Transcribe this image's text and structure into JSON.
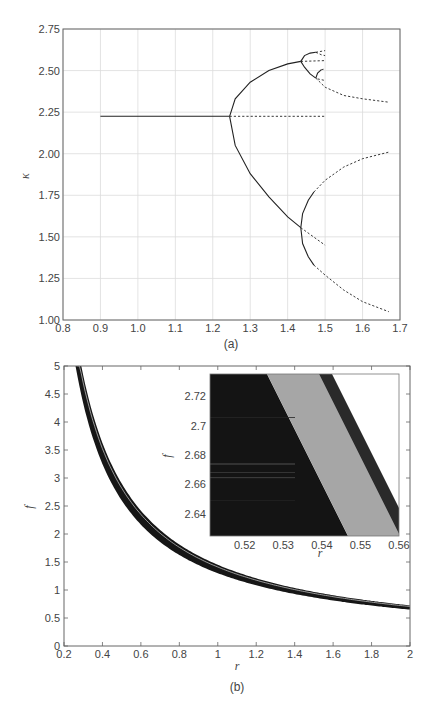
{
  "chart_data": [
    {
      "id": "a",
      "type": "line",
      "caption": "(a)",
      "title": "",
      "xlabel": "",
      "ylabel": "κ",
      "xlim": [
        0.8,
        1.7
      ],
      "ylim": [
        1.0,
        2.75
      ],
      "grid": true,
      "xticks": [
        "0.8",
        "0.9",
        "1.0",
        "1.1",
        "1.2",
        "1.3",
        "1.4",
        "1.5",
        "1.6",
        "1.7"
      ],
      "yticks": [
        "1.00",
        "1.25",
        "1.50",
        "1.75",
        "2.00",
        "2.25",
        "2.50",
        "2.75"
      ],
      "series": [
        {
          "name": "fixed point (stable)",
          "style": "solid",
          "points": [
            [
              0.9,
              2.225
            ],
            [
              1.245,
              2.225
            ]
          ]
        },
        {
          "name": "fixed point (unstable)",
          "style": "dashed",
          "points": [
            [
              1.245,
              2.225
            ],
            [
              1.5,
              2.225
            ]
          ]
        },
        {
          "name": "period-2 upper (stable)",
          "style": "solid",
          "points": [
            [
              1.245,
              2.225
            ],
            [
              1.26,
              2.33
            ],
            [
              1.3,
              2.43
            ],
            [
              1.35,
              2.5
            ],
            [
              1.4,
              2.54
            ],
            [
              1.435,
              2.555
            ]
          ]
        },
        {
          "name": "period-2 lower (stable)",
          "style": "solid",
          "points": [
            [
              1.245,
              2.225
            ],
            [
              1.26,
              2.05
            ],
            [
              1.3,
              1.88
            ],
            [
              1.35,
              1.74
            ],
            [
              1.4,
              1.62
            ],
            [
              1.435,
              1.555
            ]
          ]
        },
        {
          "name": "period-2 upper (unstable)",
          "style": "dashed",
          "points": [
            [
              1.435,
              2.555
            ],
            [
              1.5,
              2.56
            ]
          ]
        },
        {
          "name": "period-2 lower (unstable)",
          "style": "dashed",
          "points": [
            [
              1.435,
              1.555
            ],
            [
              1.5,
              1.45
            ]
          ]
        },
        {
          "name": "period-4 a (stable)",
          "style": "solid",
          "points": [
            [
              1.435,
              2.555
            ],
            [
              1.445,
              2.59
            ],
            [
              1.46,
              2.605
            ],
            [
              1.475,
              2.61
            ]
          ]
        },
        {
          "name": "period-4 b (stable)",
          "style": "solid",
          "points": [
            [
              1.435,
              2.555
            ],
            [
              1.445,
              2.52
            ],
            [
              1.46,
              2.48
            ],
            [
              1.475,
              2.455
            ]
          ]
        },
        {
          "name": "period-4 c (stable)",
          "style": "solid",
          "points": [
            [
              1.435,
              1.555
            ],
            [
              1.44,
              1.64
            ],
            [
              1.455,
              1.72
            ],
            [
              1.47,
              1.77
            ]
          ]
        },
        {
          "name": "period-4 d (stable)",
          "style": "solid",
          "points": [
            [
              1.435,
              1.555
            ],
            [
              1.44,
              1.46
            ],
            [
              1.455,
              1.38
            ],
            [
              1.47,
              1.33
            ]
          ]
        },
        {
          "name": "period-4 c (unstable)",
          "style": "dashed",
          "points": [
            [
              1.47,
              1.77
            ],
            [
              1.5,
              1.84
            ],
            [
              1.55,
              1.92
            ],
            [
              1.6,
              1.97
            ],
            [
              1.67,
              2.01
            ]
          ]
        },
        {
          "name": "period-4 d (unstable)",
          "style": "dashed",
          "points": [
            [
              1.47,
              1.33
            ],
            [
              1.5,
              1.27
            ],
            [
              1.55,
              1.18
            ],
            [
              1.6,
              1.11
            ],
            [
              1.67,
              1.05
            ]
          ]
        },
        {
          "name": "period-4 b (unstable)",
          "style": "dashed",
          "points": [
            [
              1.475,
              2.455
            ],
            [
              1.5,
              2.4
            ],
            [
              1.55,
              2.35
            ],
            [
              1.6,
              2.33
            ],
            [
              1.67,
              2.31
            ]
          ]
        },
        {
          "name": "period-8 (stable)",
          "style": "solid",
          "points": [
            [
              1.475,
              2.455
            ],
            [
              1.48,
              2.485
            ],
            [
              1.49,
              2.505
            ]
          ]
        },
        {
          "name": "period-8 (unstable)",
          "style": "dashed",
          "points": [
            [
              1.49,
              2.505
            ],
            [
              1.5,
              2.51
            ]
          ]
        },
        {
          "name": "period-8 upper (unstable)",
          "style": "dashed",
          "points": [
            [
              1.475,
              2.61
            ],
            [
              1.5,
              2.62
            ]
          ]
        },
        {
          "name": "period-8 upper b (unstable)",
          "style": "dashed",
          "points": [
            [
              1.475,
              2.61
            ],
            [
              1.49,
              2.595
            ],
            [
              1.5,
              2.59
            ]
          ]
        },
        {
          "name": "period-4 a (unstable)",
          "style": "dashed",
          "points": [
            [
              1.48,
              2.45
            ],
            [
              1.5,
              2.44
            ]
          ]
        }
      ]
    },
    {
      "id": "b",
      "type": "area",
      "caption": "(b)",
      "title": "",
      "xlabel": "r",
      "ylabel": "f",
      "xlim": [
        0.2,
        2.0
      ],
      "ylim": [
        0,
        5
      ],
      "grid": false,
      "xticks": [
        "0.2",
        "0.4",
        "0.6",
        "0.8",
        "1",
        "1.2",
        "1.4",
        "1.6",
        "1.8",
        "2"
      ],
      "yticks": [
        "0",
        "0.5",
        "1",
        "1.5",
        "2",
        "2.5",
        "3",
        "3.5",
        "4",
        "4.5",
        "5"
      ],
      "band": {
        "description": "dark band f ≈ c/r",
        "upper_c": 1.45,
        "lower_c": 1.3,
        "r": [
          0.26,
          0.3,
          0.35,
          0.4,
          0.5,
          0.6,
          0.8,
          1.0,
          1.2,
          1.4,
          1.6,
          1.8,
          2.0
        ],
        "upper_f": [
          5.0,
          4.83,
          4.14,
          3.63,
          2.9,
          2.42,
          1.81,
          1.45,
          1.21,
          1.04,
          0.91,
          0.81,
          0.73
        ],
        "lower_f": [
          5.0,
          4.33,
          3.71,
          3.25,
          2.6,
          2.17,
          1.63,
          1.3,
          1.08,
          0.93,
          0.81,
          0.72,
          0.65
        ]
      },
      "inset": {
        "xlabel": "r",
        "ylabel": "f",
        "xlim": [
          0.511,
          0.56
        ],
        "ylim": [
          2.625,
          2.735
        ],
        "xticks": [
          "0.52",
          "0.53",
          "0.54",
          "0.55",
          "0.56"
        ],
        "yticks": [
          "2.64",
          "2.66",
          "2.68",
          "2.7",
          "2.72"
        ],
        "regions": [
          {
            "name": "black region",
            "color": "#141414"
          },
          {
            "name": "gray band",
            "color": "#a6a6a6"
          },
          {
            "name": "dark band",
            "color": "#2a2a2a"
          }
        ]
      }
    }
  ]
}
